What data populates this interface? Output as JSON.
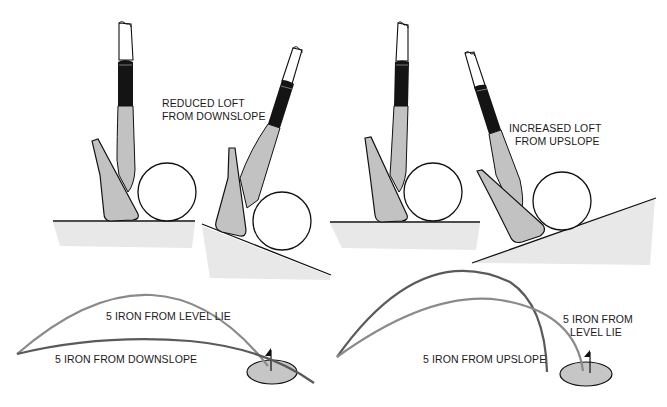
{
  "colors": {
    "background": "#ffffff",
    "club_fill": "#c2c2c2",
    "grip": "#141414",
    "outline": "#111111",
    "ground_shade": "#e6e6e6",
    "trajectory_light": "#8a8a8a",
    "trajectory_dark": "#5a5a5a",
    "green_fill": "#c6c6c6"
  },
  "top_panels": [
    {
      "id": "level-lie-left",
      "label": null
    },
    {
      "id": "downslope",
      "label_lines": [
        "REDUCED LOFT",
        "FROM DOWNSLOPE"
      ]
    },
    {
      "id": "level-lie-right",
      "label": null
    },
    {
      "id": "upslope",
      "label_lines": [
        "INCREASED LOFT",
        "FROM UPSLOPE"
      ]
    }
  ],
  "bottom_left": {
    "trajectories": [
      {
        "name": "level-lie",
        "label": "5 IRON FROM LEVEL LIE"
      },
      {
        "name": "downslope",
        "label": "5 IRON FROM DOWNSLOPE"
      }
    ]
  },
  "bottom_right": {
    "trajectories": [
      {
        "name": "upslope",
        "label": "5 IRON FROM UPSLOPE"
      },
      {
        "name": "level-lie",
        "label_lines": [
          "5 IRON FROM",
          "LEVEL LIE"
        ]
      }
    ]
  }
}
